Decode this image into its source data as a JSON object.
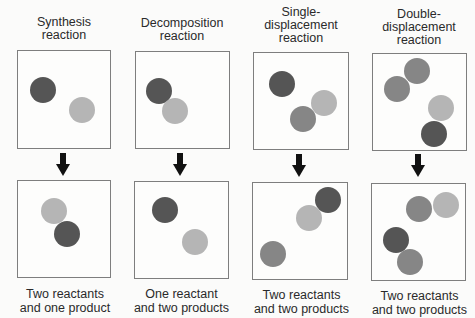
{
  "diagram": {
    "columns": [
      {
        "title": "Synthesis reaction",
        "title_lines": [
          "Synthesis",
          "reaction"
        ],
        "caption_lines": [
          "Two reactants",
          "and one product"
        ],
        "before_atoms": [
          {
            "shade": "dark",
            "x": 30,
            "y": 77
          },
          {
            "shade": "light",
            "x": 69,
            "y": 97
          }
        ],
        "after_atoms": [
          {
            "shade": "light",
            "x": 41,
            "y": 198
          },
          {
            "shade": "dark",
            "x": 54,
            "y": 221
          }
        ]
      },
      {
        "title": "Decomposition reaction",
        "title_lines": [
          "Decomposition",
          "reaction"
        ],
        "caption_lines": [
          "One reactant",
          "and two products"
        ],
        "before_atoms": [
          {
            "shade": "dark",
            "x": 146,
            "y": 78
          },
          {
            "shade": "light",
            "x": 162,
            "y": 98
          }
        ],
        "after_atoms": [
          {
            "shade": "dark",
            "x": 152,
            "y": 197
          },
          {
            "shade": "light",
            "x": 182,
            "y": 229
          }
        ]
      },
      {
        "title": "Single-displacement reaction",
        "title_lines": [
          "Single-",
          "displacement",
          "reaction"
        ],
        "caption_lines": [
          "Two reactants",
          "and two products"
        ],
        "before_atoms": [
          {
            "shade": "dark",
            "x": 269,
            "y": 71
          },
          {
            "shade": "light",
            "x": 311,
            "y": 90
          },
          {
            "shade": "mid",
            "x": 290,
            "y": 106
          }
        ],
        "after_atoms": [
          {
            "shade": "dark",
            "x": 315,
            "y": 187
          },
          {
            "shade": "light",
            "x": 296,
            "y": 205
          },
          {
            "shade": "mid",
            "x": 260,
            "y": 241
          }
        ]
      },
      {
        "title": "Double-displacement reaction",
        "title_lines": [
          "Double-",
          "displacement",
          "reaction"
        ],
        "caption_lines": [
          "Two reactants",
          "and two products"
        ],
        "before_atoms": [
          {
            "shade": "mid",
            "x": 404,
            "y": 58
          },
          {
            "shade": "mid",
            "x": 384,
            "y": 76
          },
          {
            "shade": "light",
            "x": 428,
            "y": 95
          },
          {
            "shade": "dark",
            "x": 421,
            "y": 121
          }
        ],
        "after_atoms": [
          {
            "shade": "mid",
            "x": 406,
            "y": 196
          },
          {
            "shade": "light",
            "x": 433,
            "y": 192
          },
          {
            "shade": "dark",
            "x": 383,
            "y": 227
          },
          {
            "shade": "mid",
            "x": 397,
            "y": 249
          }
        ]
      }
    ],
    "colors": {
      "dark_atom": "#555555",
      "mid_atom": "#868686",
      "light_atom": "#b5b5b5",
      "box_border": "#7e7e7e",
      "arrow": "#111111"
    }
  }
}
